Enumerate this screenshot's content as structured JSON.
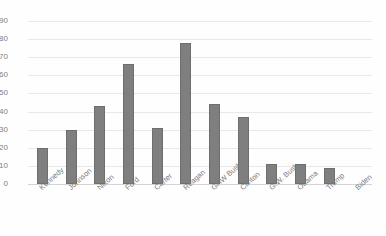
{
  "chart_data": {
    "type": "bar",
    "title": "",
    "xlabel": "",
    "ylabel": "",
    "ylim": [
      0,
      90
    ],
    "ytick_step": 10,
    "grid": true,
    "legend": "none",
    "bar_color": "#7f7f7f",
    "bar_border_color": "#6e6e6e",
    "gridline_color": "#e8e8e8",
    "categories": [
      "Kennedy",
      "Johnson",
      "Nixon",
      "Ford",
      "Carter",
      "Reagan",
      "GHW Bush",
      "Clinton",
      "G.W. Bush",
      "Obama",
      "Trump",
      "Biden"
    ],
    "values": [
      20,
      30,
      43,
      66,
      31,
      78,
      44,
      37,
      11,
      11,
      9,
      0
    ],
    "ytick_labels": [
      "90",
      "80",
      "70",
      "60",
      "50",
      "40",
      "30",
      "20",
      "10",
      "0"
    ],
    "ytick_values": [
      90,
      80,
      70,
      60,
      50,
      40,
      30,
      20,
      10,
      0
    ]
  }
}
